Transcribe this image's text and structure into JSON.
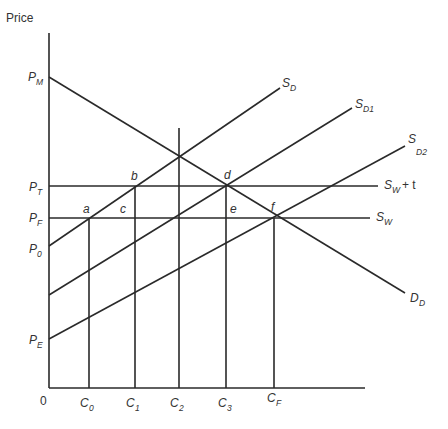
{
  "diagram": {
    "title": "",
    "y_axis_label": "Price",
    "origin_label": "0",
    "price_levels": [
      {
        "id": "PM",
        "main": "P",
        "sub": "M",
        "y": 77
      },
      {
        "id": "PT",
        "main": "P",
        "sub": "T",
        "y": 186
      },
      {
        "id": "PF",
        "main": "P",
        "sub": "F",
        "y": 218
      },
      {
        "id": "P0",
        "main": "P",
        "sub": "0",
        "y": 246
      },
      {
        "id": "PE",
        "main": "P",
        "sub": "E",
        "y": 340
      }
    ],
    "quantities": [
      {
        "id": "C0",
        "main": "C",
        "sub": "0",
        "x": 89
      },
      {
        "id": "C1",
        "main": "C",
        "sub": "1",
        "x": 135
      },
      {
        "id": "C2",
        "main": "C",
        "sub": "2",
        "x": 179
      },
      {
        "id": "C3",
        "main": "C",
        "sub": "3",
        "x": 226
      },
      {
        "id": "CF",
        "main": "C",
        "sub": "F",
        "x": 274
      }
    ],
    "curves": {
      "SD": {
        "main": "S",
        "sub": "D"
      },
      "SD1": {
        "main": "S",
        "sub": "D1"
      },
      "SD2": {
        "main": "S",
        "sub": "D2"
      },
      "DD": {
        "main": "D",
        "sub": "D"
      },
      "SWt": {
        "main": "S",
        "sub": "W",
        "suffix": "+ t"
      },
      "SW": {
        "main": "S",
        "sub": "W"
      }
    },
    "points": {
      "a": "a",
      "b": "b",
      "c": "c",
      "d": "d",
      "e": "e",
      "f": "f"
    },
    "line_color": "#2a2a2a"
  }
}
